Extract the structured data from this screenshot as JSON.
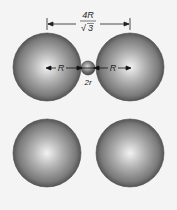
{
  "diagram": {
    "dimension_label_numerator": "4R",
    "dimension_label_denominator": "3",
    "dimension_label_sqrt": "√",
    "left_radius_label": "R",
    "right_radius_label": "R",
    "small_sphere_label": "2r",
    "spheres": [
      {
        "id": "top-left",
        "cx": 47,
        "cy": 67,
        "r": 34
      },
      {
        "id": "top-right",
        "cx": 130,
        "cy": 67,
        "r": 34
      },
      {
        "id": "bottom-left",
        "cx": 47,
        "cy": 153,
        "r": 34
      },
      {
        "id": "bottom-right",
        "cx": 130,
        "cy": 153,
        "r": 34
      }
    ],
    "small_sphere": {
      "cx": 88,
      "cy": 68,
      "r": 7
    },
    "colors": {
      "background": "#f4f4f4",
      "sphere_highlight": "#f0f0f0",
      "sphere_mid": "#9a9a9a",
      "sphere_edge": "#555555",
      "line": "#222222"
    }
  }
}
